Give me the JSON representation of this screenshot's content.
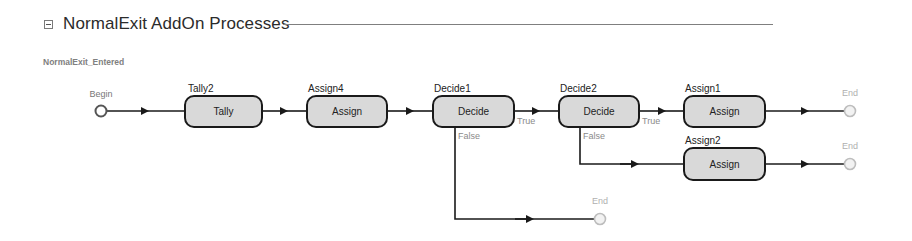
{
  "section": {
    "collapse_icon": "collapse-minus-icon",
    "title": "NormalExit AddOn Processes"
  },
  "process": {
    "name": "NormalExit_Entered",
    "begin_label": "Begin",
    "end_label": "End",
    "nodes": {
      "tally2": {
        "name": "Tally2",
        "type": "Tally"
      },
      "assign4": {
        "name": "Assign4",
        "type": "Assign"
      },
      "decide1": {
        "name": "Decide1",
        "type": "Decide"
      },
      "decide2": {
        "name": "Decide2",
        "type": "Decide"
      },
      "assign1": {
        "name": "Assign1",
        "type": "Assign"
      },
      "assign2": {
        "name": "Assign2",
        "type": "Assign"
      }
    },
    "branches": {
      "decide1_true": "True",
      "decide1_false": "False",
      "decide2_true": "True",
      "decide2_false": "False"
    }
  },
  "colors": {
    "box_fill": "#d9d9d9",
    "box_stroke": "#1a1a1a",
    "connector": "#1a1a1a",
    "begin_stroke": "#555555",
    "end_stroke": "#bdbdbd",
    "end_fill": "#f2f2f2"
  }
}
